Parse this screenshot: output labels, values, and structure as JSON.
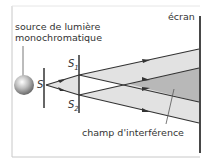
{
  "diagram": {
    "labels": {
      "source_line1": "source de lumière",
      "source_line2": "monochromatique",
      "screen": "écran",
      "slit_s": "S",
      "slit_s1": "S",
      "slit_s1_sub": "1",
      "slit_s2": "S",
      "slit_s2_sub": "2",
      "interference_field": "champ d'interférence"
    },
    "colors": {
      "line": "#333333",
      "beam_light": "#e2e2e2",
      "interference": "#b8b8b8",
      "frame": "#c8c8c8"
    }
  }
}
